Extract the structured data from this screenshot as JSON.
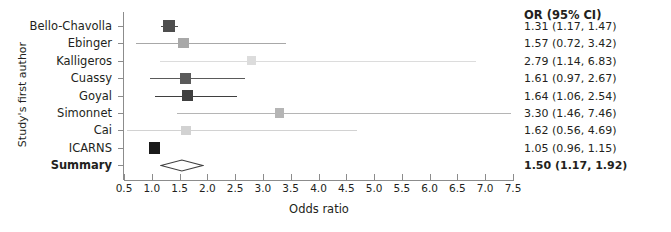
{
  "chart_data": {
    "type": "scatter",
    "subtype": "forest-plot",
    "title": "",
    "xlabel": "Odds ratio",
    "ylabel": "Study's first author",
    "xlim": [
      0.5,
      7.5
    ],
    "xticks": [
      "0.5",
      "1.0",
      "1.5",
      "2.0",
      "2.5",
      "3.0",
      "3.5",
      "4.0",
      "4.5",
      "5.0",
      "5.5",
      "6.0",
      "6.5",
      "7.0",
      "7.5"
    ],
    "xtick_values": [
      0.5,
      1.0,
      1.5,
      2.0,
      2.5,
      3.0,
      3.5,
      4.0,
      4.5,
      5.0,
      5.5,
      6.0,
      6.5,
      7.0,
      7.5
    ],
    "grid": false,
    "legend": "none",
    "categories": [
      "Bello-Chavolla",
      "Ebinger",
      "Kalligeros",
      "Cuassy",
      "Goyal",
      "Simonnet",
      "Cai",
      "ICARNS",
      "Summary"
    ],
    "or_header": "OR (95% CI)",
    "rows": [
      {
        "study": "Bello-Chavolla",
        "or": 1.31,
        "lo": 1.17,
        "hi": 1.47,
        "text": "1.31 (1.17, 1.47)",
        "weight": 0.72,
        "color": "#4d4d4d",
        "summary": false
      },
      {
        "study": "Ebinger",
        "or": 1.57,
        "lo": 0.72,
        "hi": 3.42,
        "text": "1.57 (0.72, 3.42)",
        "weight": 0.6,
        "color": "#a8a8a8",
        "summary": false
      },
      {
        "study": "Kalligeros",
        "or": 2.79,
        "lo": 1.14,
        "hi": 6.83,
        "text": "2.79 (1.14, 6.83)",
        "weight": 0.38,
        "color": "#dcdcdc",
        "summary": false
      },
      {
        "study": "Cuassy",
        "or": 1.61,
        "lo": 0.97,
        "hi": 2.67,
        "text": "1.61 (0.97, 2.67)",
        "weight": 0.68,
        "color": "#5a5a5a",
        "summary": false
      },
      {
        "study": "Goyal",
        "or": 1.64,
        "lo": 1.06,
        "hi": 2.54,
        "text": "1.64 (1.06, 2.54)",
        "weight": 0.72,
        "color": "#3f3f3f",
        "summary": false
      },
      {
        "study": "Simonnet",
        "or": 3.3,
        "lo": 1.46,
        "hi": 7.46,
        "text": "3.30 (1.46, 7.46)",
        "weight": 0.45,
        "color": "#b5b5b5",
        "summary": false
      },
      {
        "study": "Cai",
        "or": 1.62,
        "lo": 0.56,
        "hi": 4.69,
        "text": "1.62 (0.56, 4.69)",
        "weight": 0.5,
        "color": "#d2d2d2",
        "summary": false
      },
      {
        "study": "ICARNS",
        "or": 1.05,
        "lo": 0.96,
        "hi": 1.15,
        "text": "1.05 (0.96, 1.15)",
        "weight": 0.82,
        "color": "#1a1a1a",
        "summary": false
      },
      {
        "study": "Summary",
        "or": 1.5,
        "lo": 1.17,
        "hi": 1.92,
        "text": "1.50 (1.17, 1.92)",
        "weight": 1.0,
        "color": "#ffffff",
        "summary": true
      }
    ]
  },
  "axis_colors": {
    "axis_line": "#8c8c8c",
    "text": "#231f20",
    "diamond_stroke": "#3f3f3f"
  }
}
